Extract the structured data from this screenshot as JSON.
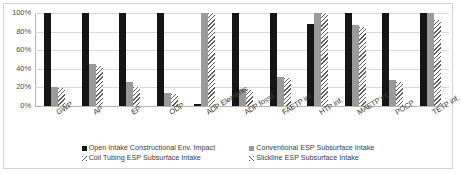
{
  "chart_data": {
    "type": "bar",
    "title": "",
    "xlabel": "",
    "ylabel": "",
    "ylim": [
      0,
      100
    ],
    "yticks": [
      "0%",
      "20%",
      "40%",
      "60%",
      "80%",
      "100%"
    ],
    "ytick_values": [
      0,
      20,
      40,
      60,
      80,
      100
    ],
    "grid": true,
    "legend_position": "bottom",
    "categories": [
      "GWP",
      "AP",
      "EP",
      "ODP",
      "ADP Elements",
      "ADP fossil",
      "FAETP inf.",
      "HTP inf.",
      "MAETP inf.",
      "POCP",
      "TETP inf."
    ],
    "series": [
      {
        "name": "Open Intake Constructional Env. Impact",
        "color": "#151515",
        "values": [
          100,
          100,
          100,
          100,
          2,
          100,
          100,
          88,
          100,
          100,
          100
        ]
      },
      {
        "name": "Conventional ESP Subsurface Intake",
        "color": "#9a9a9a",
        "values": [
          20,
          45,
          26,
          14,
          100,
          18,
          31,
          100,
          87,
          28,
          100
        ]
      },
      {
        "name": "Coil Tubing ESP Subsurface Intake",
        "color": "#efefef",
        "values": [
          19,
          43,
          20,
          13,
          100,
          17,
          30,
          100,
          85,
          26,
          92
        ]
      }
    ],
    "legend": {
      "left": [
        {
          "label": "Open Intake Constructional Env. Impact",
          "swatch": "solid-black"
        },
        {
          "label": "Coil Tubing ESP Subsurface Intake",
          "swatch": "hatched-light"
        }
      ],
      "right": [
        {
          "label": "Conventional ESP Subsurface Intake",
          "swatch": "solid-gray"
        },
        {
          "label": "Slickline ESP Subsurface Intake",
          "swatch": "hatched-light-alt"
        }
      ]
    }
  }
}
